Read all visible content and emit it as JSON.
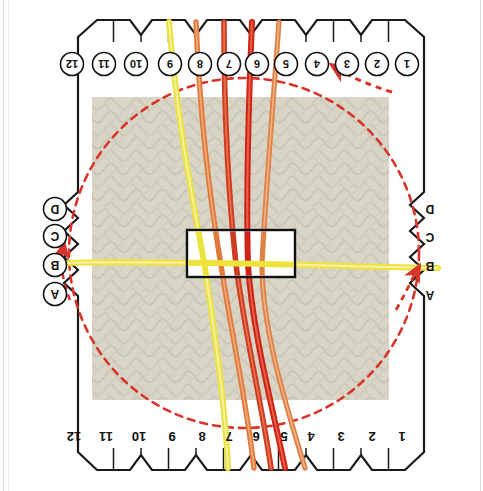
{
  "diagram": {
    "card": {
      "shape": "octagonal notched card",
      "outline_color": "#1a1a1a",
      "fill_color": "#ffffff"
    },
    "background_patch": {
      "name": "fabric-texture-patch",
      "color": "#d8d4c4",
      "description": "textured beige woven fabric square behind the card"
    },
    "center_window": {
      "name": "center-weaving-window",
      "border_color": "#111111",
      "fill_color": "#ffffff"
    },
    "top_slots": {
      "style": "circled",
      "labels": [
        "12",
        "11",
        "10",
        "9",
        "8",
        "7",
        "6",
        "5",
        "4",
        "3",
        "2",
        "1"
      ]
    },
    "bottom_slots": {
      "style": "plain",
      "labels": [
        "12",
        "11",
        "10",
        "9",
        "8",
        "7",
        "6",
        "5",
        "4",
        "3",
        "2",
        "1"
      ]
    },
    "left_slots": {
      "style": "circled",
      "labels": [
        "D",
        "C",
        "B",
        "A"
      ]
    },
    "right_slots": {
      "style": "plain",
      "labels": [
        "D",
        "C",
        "B",
        "A"
      ]
    },
    "guide_circle": {
      "name": "dashed-direction-circle",
      "color": "#d8342a",
      "style": "dashed",
      "note": "dashed red circle showing turning / rotation direction"
    },
    "arrows": [
      {
        "name": "arrow-top-right",
        "color": "#d8342a",
        "points_to": "3",
        "direction": "up-left"
      },
      {
        "name": "arrow-left",
        "color": "#d8342a",
        "points_to": "C",
        "direction": "down"
      },
      {
        "name": "arrow-right",
        "color": "#d8342a",
        "points_to": "B",
        "direction": "up-left"
      }
    ],
    "strands": [
      {
        "name": "strand-yellow-vertical",
        "color": "#e8e03a",
        "top_slot": "9",
        "bottom_slot": "8"
      },
      {
        "name": "strand-orange-1",
        "color": "#e2793c",
        "top_slot": "8",
        "bottom_slot": "7"
      },
      {
        "name": "strand-red-1",
        "color": "#cf3a1e",
        "top_slot": "7",
        "bottom_slot": "6"
      },
      {
        "name": "strand-red-2",
        "color": "#d2291b",
        "top_slot": "6",
        "bottom_slot": "5"
      },
      {
        "name": "strand-orange-2",
        "color": "#e08040",
        "top_slot": "5",
        "bottom_slot": "4"
      },
      {
        "name": "strand-yellow-horizontal",
        "color": "#eee23c",
        "left_slot": "B",
        "right_slot": "B"
      }
    ],
    "colors": {
      "red": "#d8342a",
      "orange": "#e2793c",
      "yellow": "#e8e03a",
      "outline": "#1a1a1a",
      "texture": "#d8d4c4"
    }
  }
}
